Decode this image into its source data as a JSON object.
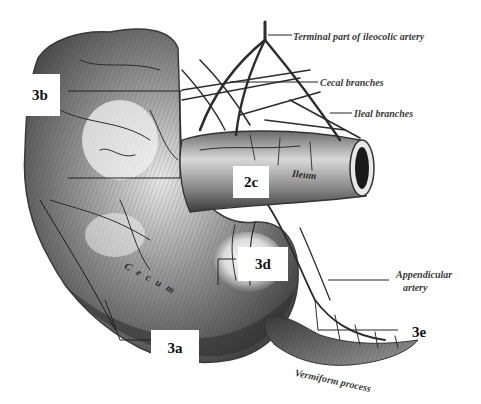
{
  "figure": {
    "captions": {
      "terminal_ileocolic": "Terminal part of ileocolic artery",
      "cecal_branches": "Cecal branches",
      "ileal_branches": "Ileal branches",
      "appendicular_artery_line1": "Appendicular",
      "appendicular_artery_line2": "artery",
      "vermiform_process": "Vermiform process",
      "ileum": "Ileum",
      "cecum": "C e c u m"
    },
    "labels": {
      "l3b": "3b",
      "l2c": "2c",
      "l3d": "3d",
      "l3a": "3a",
      "l3e": "3e"
    },
    "colors": {
      "background": "#ffffff",
      "tissue_dark": "#3c3c3c",
      "tissue_mid": "#7a7a7a",
      "tissue_light": "#c8c8c8",
      "vessel": "#2e2e2e",
      "label_box": "#ffffff",
      "label_text": "#111111"
    }
  }
}
